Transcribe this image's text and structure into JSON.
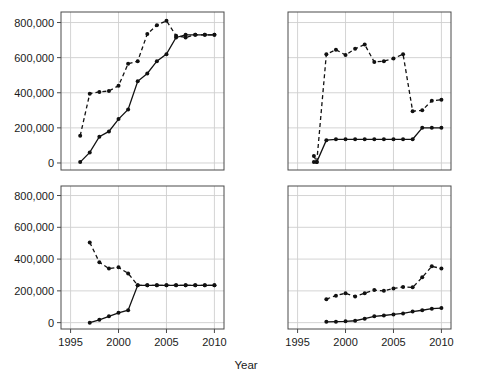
{
  "figure": {
    "layout": "2x2 panel grid of line charts",
    "xlabel": "Year",
    "ylabel": "",
    "y_ticks": [
      "0",
      "200,000",
      "400,000",
      "600,000",
      "800,000"
    ],
    "x_ticks": [
      "1995",
      "2000",
      "2005",
      "2010"
    ],
    "grid": true,
    "legend": "none"
  },
  "chart_data": [
    {
      "type": "line",
      "panel": "top-left",
      "title": "",
      "xlabel": "Year",
      "ylabel": "",
      "xlim": [
        1994,
        2011
      ],
      "ylim": [
        -40000,
        860000
      ],
      "yticks": [
        0,
        200000,
        400000,
        600000,
        800000
      ],
      "xticks": [
        1995,
        2000,
        2005,
        2010
      ],
      "grid": true,
      "series": [
        {
          "name": "dashed-series",
          "style": "dashed",
          "marker": "filled-circle",
          "x": [
            1996,
            1997,
            1998,
            1999,
            2000,
            2001,
            2002,
            2003,
            2004,
            2005,
            2006,
            2007,
            2008,
            2009,
            2010
          ],
          "values": [
            155000,
            395000,
            405000,
            410000,
            440000,
            565000,
            580000,
            735000,
            785000,
            810000,
            725000,
            715000,
            730000,
            730000,
            730000
          ]
        },
        {
          "name": "solid-series",
          "style": "solid",
          "marker": "filled-circle",
          "x": [
            1996,
            1997,
            1998,
            1999,
            2000,
            2001,
            2002,
            2003,
            2004,
            2005,
            2006,
            2007,
            2008,
            2009,
            2010
          ],
          "values": [
            5000,
            60000,
            150000,
            180000,
            250000,
            305000,
            465000,
            510000,
            580000,
            620000,
            715000,
            730000,
            730000,
            730000,
            730000
          ]
        }
      ]
    },
    {
      "type": "line",
      "panel": "top-right",
      "title": "",
      "xlabel": "Year",
      "ylabel": "",
      "xlim": [
        1994,
        2011
      ],
      "ylim": [
        -40000,
        860000
      ],
      "yticks": [
        0,
        200000,
        400000,
        600000,
        800000
      ],
      "xticks": [
        1995,
        2000,
        2005,
        2010
      ],
      "grid": true,
      "series": [
        {
          "name": "dashed-series",
          "style": "dashed",
          "marker": "filled-circle",
          "x": [
            1996.7,
            1997,
            1998,
            1999,
            2000,
            2001,
            2002,
            2003,
            2004,
            2005,
            2006,
            2007,
            2008,
            2009,
            2010
          ],
          "values": [
            40000,
            5000,
            620000,
            645000,
            615000,
            650000,
            675000,
            575000,
            580000,
            595000,
            620000,
            295000,
            300000,
            355000,
            360000
          ]
        },
        {
          "name": "solid-series",
          "style": "solid",
          "marker": "filled-circle",
          "x": [
            1996.7,
            1997,
            1998,
            1999,
            2000,
            2001,
            2002,
            2003,
            2004,
            2005,
            2006,
            2007,
            2008,
            2009,
            2010
          ],
          "values": [
            5000,
            5000,
            130000,
            135000,
            135000,
            135000,
            135000,
            135000,
            135000,
            135000,
            135000,
            135000,
            200000,
            200000,
            200000
          ]
        }
      ]
    },
    {
      "type": "line",
      "panel": "bottom-left",
      "title": "",
      "xlabel": "Year",
      "ylabel": "",
      "xlim": [
        1994,
        2011
      ],
      "ylim": [
        -40000,
        860000
      ],
      "yticks": [
        0,
        200000,
        400000,
        600000,
        800000
      ],
      "xticks": [
        1995,
        2000,
        2005,
        2010
      ],
      "grid": true,
      "series": [
        {
          "name": "dashed-series",
          "style": "dashed",
          "marker": "filled-circle",
          "x": [
            1997,
            1998,
            1999,
            2000,
            2001,
            2002,
            2003,
            2004,
            2005,
            2006,
            2007,
            2008,
            2009,
            2010
          ],
          "values": [
            505000,
            380000,
            340000,
            348000,
            310000,
            235000,
            235000,
            235000,
            235000,
            235000,
            235000,
            235000,
            235000,
            235000
          ]
        },
        {
          "name": "solid-series",
          "style": "solid",
          "marker": "filled-circle",
          "x": [
            1997,
            1998,
            1999,
            2000,
            2001,
            2002,
            2003,
            2004,
            2005,
            2006,
            2007,
            2008,
            2009,
            2010
          ],
          "values": [
            0,
            18000,
            40000,
            62000,
            78000,
            235000,
            235000,
            235000,
            235000,
            235000,
            235000,
            235000,
            235000,
            235000
          ]
        }
      ]
    },
    {
      "type": "line",
      "panel": "bottom-right",
      "title": "",
      "xlabel": "Year",
      "ylabel": "",
      "xlim": [
        1994,
        2011
      ],
      "ylim": [
        -40000,
        860000
      ],
      "yticks": [
        0,
        200000,
        400000,
        600000,
        800000
      ],
      "xticks": [
        1995,
        2000,
        2005,
        2010
      ],
      "grid": true,
      "series": [
        {
          "name": "dashed-series",
          "style": "dashed",
          "marker": "filled-circle",
          "x": [
            1998,
            1999,
            2000,
            2001,
            2002,
            2003,
            2004,
            2005,
            2006,
            2007,
            2008,
            2009,
            2010
          ],
          "values": [
            148000,
            170000,
            185000,
            165000,
            185000,
            205000,
            200000,
            215000,
            225000,
            222000,
            285000,
            355000,
            340000
          ]
        },
        {
          "name": "solid-series",
          "style": "solid",
          "marker": "filled-circle",
          "x": [
            1998,
            1999,
            2000,
            2001,
            2002,
            2003,
            2004,
            2005,
            2006,
            2007,
            2008,
            2009,
            2010
          ],
          "values": [
            5000,
            6000,
            8000,
            12000,
            25000,
            40000,
            45000,
            52000,
            58000,
            70000,
            78000,
            88000,
            92000
          ]
        }
      ]
    }
  ]
}
